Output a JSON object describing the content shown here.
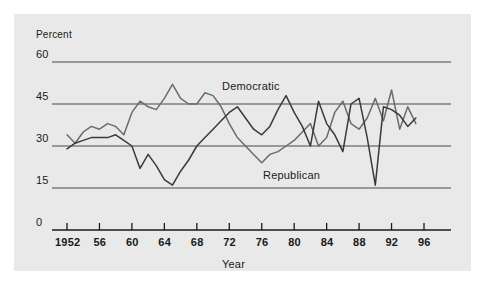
{
  "figure": {
    "background": "#e9e9e9",
    "page_background": "#ffffff",
    "unit_label": "Percent",
    "axis_title_x": "Year",
    "gridline_color": "#4a4a4a",
    "axis_color": "#1a1a1a"
  },
  "chart_data": {
    "type": "line",
    "title": "",
    "subtitle": "",
    "xlabel": "Year",
    "ylabel": "Percent",
    "unit_label": "Percent",
    "xlim": [
      1951,
      1997
    ],
    "ylim": [
      0,
      60
    ],
    "yticks": [
      0,
      15,
      30,
      45,
      60
    ],
    "ytick_labels": [
      "0",
      "15",
      "30",
      "45",
      "60"
    ],
    "xticks": [
      1952,
      1956,
      1960,
      1964,
      1968,
      1972,
      1976,
      1980,
      1984,
      1988,
      1992,
      1996
    ],
    "xtick_labels": [
      "1952",
      "56",
      "60",
      "64",
      "68",
      "72",
      "76",
      "80",
      "84",
      "88",
      "92",
      "96"
    ],
    "grid": "horizontal",
    "legend_position": "inline-annotations",
    "annotations": [
      {
        "text": "Democratic",
        "x": 1973.5,
        "y": 49.5
      },
      {
        "text": "Republican",
        "x": 1978.5,
        "y": 18.5
      }
    ],
    "series": [
      {
        "name": "Democratic",
        "color": "#6b6b6b",
        "x": [
          1952,
          1953,
          1954,
          1955,
          1956,
          1957,
          1958,
          1959,
          1960,
          1961,
          1962,
          1963,
          1964,
          1965,
          1966,
          1967,
          1968,
          1969,
          1970,
          1971,
          1972,
          1973,
          1974,
          1975,
          1976,
          1977,
          1978,
          1979,
          1980,
          1981,
          1982,
          1983,
          1984,
          1985,
          1986,
          1987,
          1988,
          1989,
          1990,
          1991,
          1992,
          1993,
          1994,
          1995
        ],
        "values": [
          34,
          31,
          35,
          37,
          36,
          38,
          37,
          34,
          42,
          46,
          44,
          43,
          47,
          52,
          47,
          45,
          45,
          49,
          48,
          44,
          38,
          33,
          30,
          27,
          24,
          27,
          28,
          30,
          32,
          35,
          38,
          30,
          33,
          42,
          46,
          38,
          36,
          40,
          47,
          39,
          50,
          36,
          44,
          38
        ]
      },
      {
        "name": "Republican",
        "color": "#3a3a3a",
        "x": [
          1952,
          1953,
          1954,
          1955,
          1956,
          1957,
          1958,
          1959,
          1960,
          1961,
          1962,
          1963,
          1964,
          1965,
          1966,
          1967,
          1968,
          1969,
          1970,
          1971,
          1972,
          1973,
          1974,
          1975,
          1976,
          1977,
          1978,
          1979,
          1980,
          1981,
          1982,
          1983,
          1984,
          1985,
          1986,
          1987,
          1988,
          1989,
          1990,
          1991,
          1992,
          1993,
          1994,
          1995
        ],
        "values": [
          29,
          31,
          32,
          33,
          33,
          33,
          34,
          32,
          30,
          22,
          27,
          23,
          18,
          16,
          21,
          25,
          30,
          33,
          36,
          39,
          42,
          44,
          40,
          36,
          34,
          37,
          43,
          48,
          42,
          37,
          30,
          46,
          38,
          34,
          28,
          45,
          47,
          33,
          16,
          44,
          43,
          41,
          37,
          40
        ]
      }
    ]
  }
}
